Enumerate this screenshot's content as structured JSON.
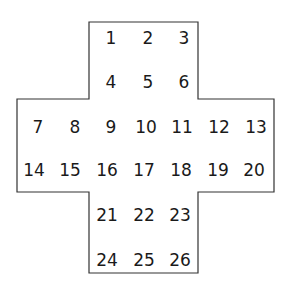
{
  "diagram": {
    "type": "cross-shaped number grid",
    "outline_color": "#333333",
    "rows": [
      {
        "numbers": [
          "1",
          "2",
          "3"
        ]
      },
      {
        "numbers": [
          "4",
          "5",
          "6"
        ]
      },
      {
        "numbers": [
          "7",
          "8",
          "9",
          "10",
          "11",
          "12",
          "13"
        ]
      },
      {
        "numbers": [
          "14",
          "15",
          "16",
          "17",
          "18",
          "19",
          "20"
        ]
      },
      {
        "numbers": [
          "21",
          "22",
          "23"
        ]
      },
      {
        "numbers": [
          "24",
          "25",
          "26"
        ]
      }
    ]
  }
}
